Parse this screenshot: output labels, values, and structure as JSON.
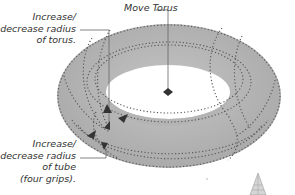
{
  "diagram": {
    "colors": {
      "torus_fill": "#b9b9b9",
      "torus_shade": "#a9a9a9",
      "dotted_lines": "#555555",
      "grips": "#333333",
      "leader_lines": "#666666",
      "label_text": "#333333",
      "background": "#ffffff"
    },
    "callouts": [
      {
        "id": "move",
        "lines": [
          "Move Torus"
        ],
        "target": "center-grip-diamond"
      },
      {
        "id": "torus-radius",
        "lines": [
          "Increase/",
          "decrease radius",
          "of torus."
        ],
        "target": "torus-radius-grip"
      },
      {
        "id": "tube-radius",
        "lines": [
          "Increase/",
          "decrease radius",
          "of tube",
          "(four grips)."
        ],
        "target": "tube-radius-grips"
      }
    ],
    "grips": {
      "center": "diamond",
      "torus_radius": "triangle",
      "tube_radius_count": 4
    },
    "corner_icon": "ucs-cone-icon"
  }
}
